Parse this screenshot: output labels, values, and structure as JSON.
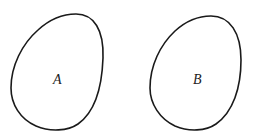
{
  "diagram": {
    "type": "sets",
    "sets": [
      {
        "id": "A",
        "label": "A"
      },
      {
        "id": "B",
        "label": "B"
      }
    ],
    "relationship": "disjoint",
    "colors": {
      "stroke": "#1a1a1a",
      "background": "#ffffff",
      "label": "#222222"
    }
  }
}
